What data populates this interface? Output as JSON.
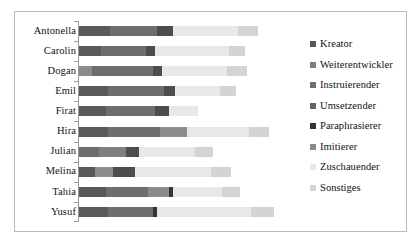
{
  "chart_data": {
    "type": "bar",
    "orientation": "horizontal",
    "stacked": true,
    "title": "",
    "xlabel": "",
    "ylabel": "",
    "grid": false,
    "legend_position": "right",
    "axis_line": true,
    "xlim": [
      0,
      100
    ],
    "categories": [
      "Antonella",
      "Carolin",
      "Dogan",
      "Emil",
      "Firat",
      "Hira",
      "Julian",
      "Melina",
      "Tahia",
      "Yusuf"
    ],
    "series": [
      {
        "name": "Kreator",
        "color": "#595959",
        "values": [
          14,
          10,
          6,
          13,
          12,
          13,
          9,
          7,
          12,
          13
        ]
      },
      {
        "name": "Weiterentwickler",
        "color": "#7f7f7f",
        "values": [
          0,
          0,
          0,
          0,
          0,
          0,
          0,
          0,
          0,
          0
        ]
      },
      {
        "name": "Instruierender",
        "color": "#6e6e6e",
        "values": [
          21,
          20,
          27,
          25,
          22,
          23,
          12,
          0,
          19,
          20
        ]
      },
      {
        "name": "Umsetzender",
        "color": "#4d4d4d",
        "values": [
          7,
          4,
          4,
          5,
          6,
          0,
          6,
          10,
          0,
          0
        ]
      },
      {
        "name": "Paraphrasierer",
        "color": "#333333",
        "values": [
          0,
          0,
          0,
          0,
          0,
          0,
          0,
          0,
          2,
          2
        ]
      },
      {
        "name": "Imitierer",
        "color": "#8c8c8c",
        "values": [
          0,
          0,
          0,
          0,
          0,
          12,
          0,
          0,
          9,
          0
        ]
      },
      {
        "name": "Zuschauender",
        "color": "#e8e8e8",
        "values": [
          29,
          33,
          29,
          20,
          13,
          28,
          25,
          34,
          22,
          42
        ]
      },
      {
        "name": "Sonstiges",
        "color": "#d4d4d4",
        "values": [
          9,
          7,
          9,
          7,
          0,
          9,
          8,
          9,
          8,
          10
        ]
      }
    ],
    "bars": [
      {
        "category": "Antonella",
        "segments": [
          {
            "series": "Kreator",
            "value": 14,
            "color": "#595959"
          },
          {
            "series": "Instruierender",
            "value": 21,
            "color": "#6e6e6e"
          },
          {
            "series": "Umsetzender",
            "value": 7,
            "color": "#4d4d4d"
          },
          {
            "series": "Zuschauender",
            "value": 29,
            "color": "#e8e8e8"
          },
          {
            "series": "Sonstiges",
            "value": 9,
            "color": "#d4d4d4"
          }
        ]
      },
      {
        "category": "Carolin",
        "segments": [
          {
            "series": "Kreator",
            "value": 10,
            "color": "#595959"
          },
          {
            "series": "Instruierender",
            "value": 20,
            "color": "#6e6e6e"
          },
          {
            "series": "Umsetzender",
            "value": 4,
            "color": "#4d4d4d"
          },
          {
            "series": "Zuschauender",
            "value": 33,
            "color": "#e8e8e8"
          },
          {
            "series": "Sonstiges",
            "value": 7,
            "color": "#d4d4d4"
          }
        ]
      },
      {
        "category": "Dogan",
        "segments": [
          {
            "series": "Kreator",
            "value": 6,
            "color": "#8c8c8c"
          },
          {
            "series": "Instruierender",
            "value": 27,
            "color": "#6e6e6e"
          },
          {
            "series": "Umsetzender",
            "value": 4,
            "color": "#4d4d4d"
          },
          {
            "series": "Zuschauender",
            "value": 29,
            "color": "#e8e8e8"
          },
          {
            "series": "Sonstiges",
            "value": 9,
            "color": "#d4d4d4"
          }
        ]
      },
      {
        "category": "Emil",
        "segments": [
          {
            "series": "Kreator",
            "value": 13,
            "color": "#595959"
          },
          {
            "series": "Instruierender",
            "value": 25,
            "color": "#6e6e6e"
          },
          {
            "series": "Umsetzender",
            "value": 5,
            "color": "#4d4d4d"
          },
          {
            "series": "Zuschauender",
            "value": 20,
            "color": "#e8e8e8"
          },
          {
            "series": "Sonstiges",
            "value": 7,
            "color": "#d4d4d4"
          }
        ]
      },
      {
        "category": "Firat",
        "segments": [
          {
            "series": "Kreator",
            "value": 12,
            "color": "#595959"
          },
          {
            "series": "Instruierender",
            "value": 22,
            "color": "#6e6e6e"
          },
          {
            "series": "Umsetzender",
            "value": 6,
            "color": "#4d4d4d"
          },
          {
            "series": "Zuschauender",
            "value": 13,
            "color": "#e8e8e8"
          }
        ]
      },
      {
        "category": "Hira",
        "segments": [
          {
            "series": "Kreator",
            "value": 13,
            "color": "#595959"
          },
          {
            "series": "Instruierender",
            "value": 23,
            "color": "#6e6e6e"
          },
          {
            "series": "Imitierer",
            "value": 12,
            "color": "#8c8c8c"
          },
          {
            "series": "Zuschauender",
            "value": 28,
            "color": "#e8e8e8"
          },
          {
            "series": "Sonstiges",
            "value": 9,
            "color": "#d4d4d4"
          }
        ]
      },
      {
        "category": "Julian",
        "segments": [
          {
            "series": "Kreator",
            "value": 9,
            "color": "#6e6e6e"
          },
          {
            "series": "Instruierender",
            "value": 12,
            "color": "#7f7f7f"
          },
          {
            "series": "Umsetzender",
            "value": 6,
            "color": "#4d4d4d"
          },
          {
            "series": "Zuschauender",
            "value": 25,
            "color": "#e8e8e8"
          },
          {
            "series": "Sonstiges",
            "value": 8,
            "color": "#d4d4d4"
          }
        ]
      },
      {
        "category": "Melina",
        "segments": [
          {
            "series": "Kreator",
            "value": 7,
            "color": "#595959"
          },
          {
            "series": "Instruierender",
            "value": 8,
            "color": "#8c8c8c"
          },
          {
            "series": "Umsetzender",
            "value": 10,
            "color": "#4d4d4d"
          },
          {
            "series": "Zuschauender",
            "value": 34,
            "color": "#e8e8e8"
          },
          {
            "series": "Sonstiges",
            "value": 9,
            "color": "#d4d4d4"
          }
        ]
      },
      {
        "category": "Tahia",
        "segments": [
          {
            "series": "Kreator",
            "value": 12,
            "color": "#595959"
          },
          {
            "series": "Instruierender",
            "value": 19,
            "color": "#6e6e6e"
          },
          {
            "series": "Imitierer",
            "value": 9,
            "color": "#8c8c8c"
          },
          {
            "series": "Paraphrasierer",
            "value": 2,
            "color": "#333333"
          },
          {
            "series": "Zuschauender",
            "value": 22,
            "color": "#e8e8e8"
          },
          {
            "series": "Sonstiges",
            "value": 8,
            "color": "#d4d4d4"
          }
        ]
      },
      {
        "category": "Yusuf",
        "segments": [
          {
            "series": "Kreator",
            "value": 13,
            "color": "#595959"
          },
          {
            "series": "Instruierender",
            "value": 20,
            "color": "#6e6e6e"
          },
          {
            "series": "Paraphrasierer",
            "value": 2,
            "color": "#333333"
          },
          {
            "series": "Zuschauender",
            "value": 42,
            "color": "#e8e8e8"
          },
          {
            "series": "Sonstiges",
            "value": 10,
            "color": "#d4d4d4"
          }
        ]
      }
    ],
    "legend": [
      {
        "label": "Kreator",
        "color": "#595959"
      },
      {
        "label": "Weiterentwickler",
        "color": "#7f7f7f"
      },
      {
        "label": "Instruierender",
        "color": "#6e6e6e"
      },
      {
        "label": "Umsetzender",
        "color": "#666666"
      },
      {
        "label": "Paraphrasierer",
        "color": "#333333"
      },
      {
        "label": "Imitierer",
        "color": "#8c8c8c"
      },
      {
        "label": "Zuschauender",
        "color": "#e8e8e8"
      },
      {
        "label": "Sonstiges",
        "color": "#d4d4d4"
      }
    ]
  }
}
